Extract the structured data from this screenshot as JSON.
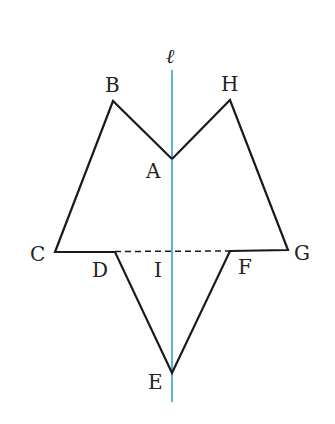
{
  "diagram": {
    "axis_label": "ℓ",
    "colors": {
      "axis": "#5ab4d6",
      "shape": "#1a1a1a",
      "background": "#ffffff"
    },
    "points": {
      "A": "A",
      "B": "B",
      "C": "C",
      "D": "D",
      "E": "E",
      "F": "F",
      "G": "G",
      "H": "H",
      "I": "I"
    }
  }
}
